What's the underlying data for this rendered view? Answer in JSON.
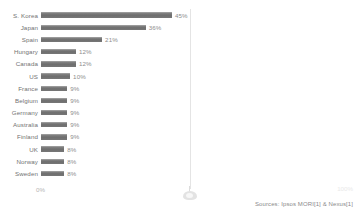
{
  "chart_data": {
    "type": "bar",
    "orientation": "horizontal",
    "title": "",
    "xlabel": "",
    "ylabel": "",
    "xlim": [
      0,
      100
    ],
    "grid": true,
    "gridlines_at": [
      50
    ],
    "legend": "none",
    "categories": [
      "S. Korea",
      "Japan",
      "Spain",
      "Hungary",
      "Canada",
      "US",
      "France",
      "Belgium",
      "Germany",
      "Australia",
      "Finland",
      "UK",
      "Norway",
      "Sweden"
    ],
    "values": [
      45,
      36,
      21,
      12,
      12,
      10,
      9,
      9,
      9,
      9,
      9,
      8,
      8,
      8
    ],
    "value_labels": [
      "45%",
      "36%",
      "21%",
      "12%",
      "12%",
      "10%",
      "9%",
      "9%",
      "9%",
      "9%",
      "9%",
      "8%",
      "8%",
      "8%"
    ],
    "axis": {
      "min_label": "0%",
      "max_label": "100%"
    },
    "annotations": {
      "source": "Sources: Ipsos MORI[1] & Nexus[1]"
    },
    "colors": {
      "bar": "#737373",
      "bar_highlight": "#828282",
      "label_text": "#727272",
      "value_text": "#8d8d8d",
      "gridline": "#e4e4e4",
      "axis_text": "#b4b4b4",
      "background": "#ffffff"
    }
  }
}
